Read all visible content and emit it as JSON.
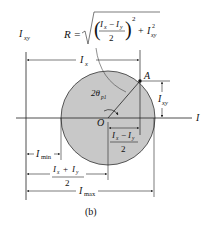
{
  "figure": {
    "caption": "(b)",
    "type": "Mohr's circle for moments and product of inertia"
  },
  "axes": {
    "vertical_label": "I",
    "vertical_sub": "xy",
    "horizontal_label": "I"
  },
  "points": {
    "center": "O",
    "point": "A"
  },
  "formula": {
    "lhs": "R =",
    "num_a": "I",
    "num_a_sub": "x",
    "minus": "−",
    "num_b": "I",
    "num_b_sub": "y",
    "den": "2",
    "exp": "2",
    "plus": "+",
    "term": "I",
    "term_sub": "xy",
    "term_exp": "2"
  },
  "angle": {
    "label": "2θ",
    "sub": "p1"
  },
  "dimensions": {
    "ix": {
      "label": "I",
      "sub": "x"
    },
    "ixy": {
      "label": "I",
      "sub": "xy"
    },
    "half_diff": {
      "a": "I",
      "a_sub": "x",
      "op": "−",
      "b": "I",
      "b_sub": "y",
      "den": "2"
    },
    "imin": {
      "label": "I",
      "sub": "min"
    },
    "half_sum": {
      "a": "I",
      "a_sub": "x",
      "op": "+",
      "b": "I",
      "b_sub": "y",
      "den": "2"
    },
    "imax": {
      "label": "I",
      "sub": "max"
    }
  },
  "colors": {
    "circle_fill": "#c8c8c8",
    "line": "#222222"
  }
}
